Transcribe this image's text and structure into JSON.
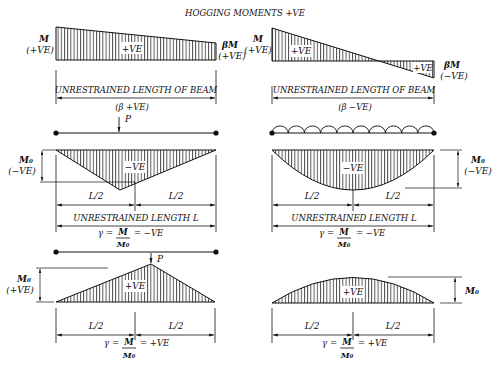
{
  "title": "HOGGING MOMENTS +VE",
  "panels": {
    "p1": {
      "left_moment": "M",
      "left_sign": "(+VE)",
      "right_moment": "βM",
      "right_sign": "(+VE)",
      "region_label": "+VE",
      "span_label": "UNRESTRAINED LENGTH OF BEAM",
      "case_label": "(β  +VE)"
    },
    "p2": {
      "left_moment": "M",
      "left_sign": "(+VE)",
      "right_moment": "βM",
      "right_sign": "(−VE)",
      "region_label_1": "+VE",
      "region_label_2": "+VE",
      "span_label": "UNRESTRAINED LENGTH OF BEAM",
      "case_label": "(β  −VE)"
    },
    "p3": {
      "load": "P",
      "moment": "M₀",
      "moment_sign": "(−VE)",
      "region_label": "−VE",
      "half_left": "L/2",
      "half_right": "L/2",
      "span_label": "UNRESTRAINED LENGTH L",
      "gamma_lhs": "γ =",
      "gamma_num": "M",
      "gamma_den": "M₀",
      "gamma_rhs": "= −VE"
    },
    "p4": {
      "moment": "M₀",
      "moment_sign": "(−VE)",
      "region_label": "−VE",
      "half_left": "L/2",
      "half_right": "L/2",
      "span_label": "UNRESTRAINED LENGTH L",
      "gamma_lhs": "γ =",
      "gamma_num": "M",
      "gamma_den": "M₀",
      "gamma_rhs": "= −VE"
    },
    "p5": {
      "load": "P",
      "moment": "M₀",
      "moment_sign": "(+VE)",
      "region_label": "+VE",
      "half_left": "L/2",
      "half_right": "L/2",
      "gamma_lhs": "γ =",
      "gamma_num": "M",
      "gamma_den": "M₀",
      "gamma_rhs": "= +VE"
    },
    "p6": {
      "moment": "M₀",
      "region_label": "+VE",
      "half_left": "L/2",
      "half_right": "L/2",
      "gamma_lhs": "γ =",
      "gamma_num": "M",
      "gamma_den": "M₀",
      "gamma_rhs": "= +VE"
    }
  }
}
